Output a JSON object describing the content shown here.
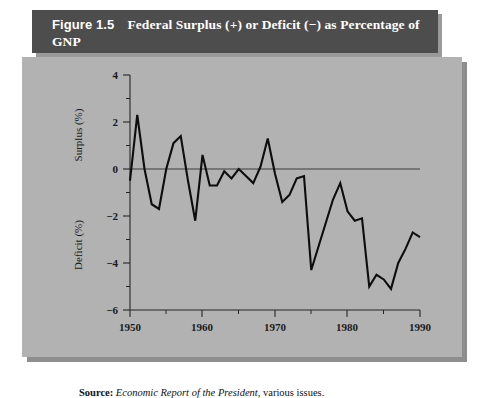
{
  "figure": {
    "number": "Figure 1.5",
    "title": "Federal Surplus (+) or Deficit (−) as Percentage of GNP"
  },
  "source": {
    "label": "Source:",
    "publication": "Economic Report of the President",
    "suffix": ", various issues."
  },
  "axes": {
    "y_upper_label": "Surplus (%)",
    "y_lower_label": "Deficit (%)",
    "y_ticks": [
      "4",
      "2",
      "0",
      "−2",
      "−4",
      "−6"
    ],
    "x_ticks": [
      "1950",
      "1960",
      "1970",
      "1980",
      "1990"
    ]
  },
  "colors": {
    "title_bar": "#4d4d4d",
    "title_text": "#ffffff",
    "panel": "#b2b2b2",
    "shadow": "#8e8e8e",
    "line": "#0d0d0d",
    "axis": "#262626",
    "page": "#ffffff"
  },
  "chart_data": {
    "type": "line",
    "title": "Federal Surplus (+) or Deficit (−) as Percentage of GNP",
    "xlabel": "",
    "ylabel": "Surplus (%) / Deficit (%)",
    "xlim": [
      1950,
      1990
    ],
    "ylim": [
      -6,
      4
    ],
    "y_major_step": 2,
    "y_minor_step": 1,
    "x_major_step": 10,
    "x_minor_step": 5,
    "grid": false,
    "legend": false,
    "zero_reference_line": 0,
    "x": [
      1950,
      1951,
      1952,
      1953,
      1954,
      1955,
      1956,
      1957,
      1958,
      1959,
      1960,
      1961,
      1962,
      1963,
      1964,
      1965,
      1966,
      1967,
      1968,
      1969,
      1970,
      1971,
      1972,
      1973,
      1974,
      1975,
      1976,
      1977,
      1978,
      1979,
      1980,
      1981,
      1982,
      1983,
      1984,
      1985,
      1986,
      1987,
      1988,
      1989,
      1990
    ],
    "values": [
      -0.5,
      2.3,
      0.0,
      -1.5,
      -1.7,
      0.0,
      1.1,
      1.4,
      -0.5,
      -2.2,
      0.6,
      -0.7,
      -0.7,
      -0.1,
      -0.4,
      0.0,
      -0.3,
      -0.6,
      0.1,
      1.3,
      -0.2,
      -1.4,
      -1.1,
      -0.4,
      -0.3,
      -4.3,
      -3.3,
      -2.3,
      -1.3,
      -0.6,
      -1.8,
      -2.2,
      -2.1,
      -5.0,
      -4.5,
      -4.7,
      -5.1,
      -4.0,
      -3.4,
      -2.7,
      -2.9
    ]
  }
}
